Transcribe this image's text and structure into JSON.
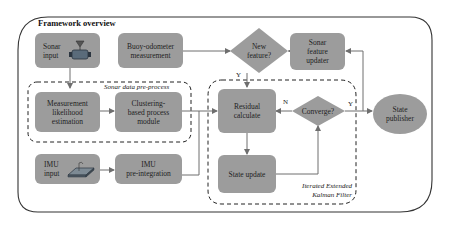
{
  "title": "Framework overview",
  "colors": {
    "node_fill": "#9c9c9c",
    "line": "#6e6e6e",
    "frame": "#333333",
    "dashed": "#222222"
  },
  "nodes": {
    "sonar_input": {
      "line1": "Sonar",
      "line2": "input",
      "icon": "sonar-device-icon"
    },
    "buoy_odometer": {
      "line1": "Buoy-odometer",
      "line2": "measurement"
    },
    "new_feature": {
      "line1": "New",
      "line2": "feature?"
    },
    "sonar_feature_updater": {
      "line1": "Sonar",
      "line2": "feature",
      "line3": "updater"
    },
    "measurement_likelihood": {
      "line1": "Measurement",
      "line2": "likelihood",
      "line3": "estimation"
    },
    "clustering_module": {
      "line1": "Clustering-",
      "line2": "based process",
      "line3": "module"
    },
    "residual_calculate": {
      "line1": "Residual",
      "line2": "calculate"
    },
    "converge": {
      "line1": "Converge?"
    },
    "state_update": {
      "line1": "State update"
    },
    "state_publisher": {
      "line1": "State",
      "line2": "publisher"
    },
    "imu_input": {
      "line1": "IMU",
      "line2": "input",
      "icon": "imu-board-icon"
    },
    "imu_preintegration": {
      "line1": "IMU",
      "line2": "pre-integration"
    }
  },
  "groups": {
    "sonar_preprocess": {
      "label": "Sonar data pre-process"
    },
    "iekf": {
      "line1": "Iterated Extended",
      "line2": "Kalman Filter"
    }
  },
  "edge_labels": {
    "new_feature_yes": "Y",
    "converge_no": "N",
    "converge_yes": "Y"
  }
}
